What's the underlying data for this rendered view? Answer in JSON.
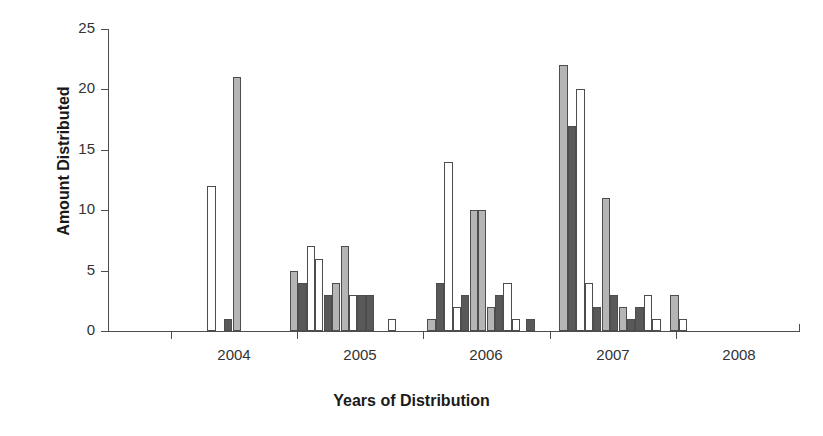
{
  "chart_data": {
    "type": "bar",
    "title": "",
    "xlabel": "Years of Distribution",
    "ylabel": "Amount Distributed",
    "ylim": [
      0,
      25
    ],
    "ytick_labels": [
      "0",
      "5",
      "10",
      "15",
      "20",
      "25"
    ],
    "ytick_values": [
      0,
      5,
      10,
      15,
      20,
      25
    ],
    "xtick_labels": [
      "2004",
      "2005",
      "2006",
      "2007",
      "2008"
    ],
    "grid": false,
    "legend": false,
    "series_styles": [
      {
        "name": "light-gray",
        "color": "#b5b5b5"
      },
      {
        "name": "dark-gray",
        "color": "#595959"
      },
      {
        "name": "white",
        "color": "#ffffff"
      }
    ],
    "bars": [
      {
        "x": 12.35,
        "value": 12,
        "style": "white"
      },
      {
        "x": 14.45,
        "value": 1,
        "style": "dark"
      },
      {
        "x": 15.5,
        "value": 21,
        "style": "light"
      },
      {
        "x": 22.6,
        "value": 5,
        "style": "light"
      },
      {
        "x": 23.65,
        "value": 4,
        "style": "dark"
      },
      {
        "x": 24.7,
        "value": 7,
        "style": "white"
      },
      {
        "x": 25.75,
        "value": 6,
        "style": "white"
      },
      {
        "x": 26.8,
        "value": 3,
        "style": "dark"
      },
      {
        "x": 27.85,
        "value": 4,
        "style": "light"
      },
      {
        "x": 28.9,
        "value": 7,
        "style": "light"
      },
      {
        "x": 29.95,
        "value": 3,
        "style": "white"
      },
      {
        "x": 31.0,
        "value": 3,
        "style": "dark"
      },
      {
        "x": 32.05,
        "value": 3,
        "style": "dark"
      },
      {
        "x": 34.8,
        "value": 1,
        "style": "white"
      },
      {
        "x": 39.7,
        "value": 1,
        "style": "light"
      },
      {
        "x": 40.75,
        "value": 4,
        "style": "dark"
      },
      {
        "x": 41.8,
        "value": 14,
        "style": "white"
      },
      {
        "x": 42.85,
        "value": 2,
        "style": "white"
      },
      {
        "x": 43.9,
        "value": 3,
        "style": "dark"
      },
      {
        "x": 44.95,
        "value": 10,
        "style": "light"
      },
      {
        "x": 46.0,
        "value": 10,
        "style": "light"
      },
      {
        "x": 47.05,
        "value": 2,
        "style": "light"
      },
      {
        "x": 48.1,
        "value": 3,
        "style": "dark"
      },
      {
        "x": 49.15,
        "value": 4,
        "style": "white"
      },
      {
        "x": 50.2,
        "value": 1,
        "style": "white"
      },
      {
        "x": 52.0,
        "value": 1,
        "style": "dark"
      },
      {
        "x": 56.1,
        "value": 22,
        "style": "light"
      },
      {
        "x": 57.15,
        "value": 17,
        "style": "dark"
      },
      {
        "x": 58.2,
        "value": 20,
        "style": "white"
      },
      {
        "x": 59.25,
        "value": 4,
        "style": "white"
      },
      {
        "x": 60.3,
        "value": 2,
        "style": "dark"
      },
      {
        "x": 61.35,
        "value": 11,
        "style": "light"
      },
      {
        "x": 62.4,
        "value": 3,
        "style": "dark"
      },
      {
        "x": 63.45,
        "value": 2,
        "style": "light"
      },
      {
        "x": 64.5,
        "value": 1,
        "style": "dark"
      },
      {
        "x": 65.55,
        "value": 2,
        "style": "dark"
      },
      {
        "x": 66.6,
        "value": 3,
        "style": "white"
      },
      {
        "x": 67.65,
        "value": 1,
        "style": "white"
      },
      {
        "x": 69.9,
        "value": 3,
        "style": "light"
      },
      {
        "x": 70.95,
        "value": 1,
        "style": "white"
      }
    ],
    "xtick_positions": [
      7.8,
      23.5,
      39.2,
      54.9,
      70.6
    ],
    "xlabel_positions": [
      15.6,
      31.3,
      47.0,
      62.7,
      78.4
    ]
  }
}
